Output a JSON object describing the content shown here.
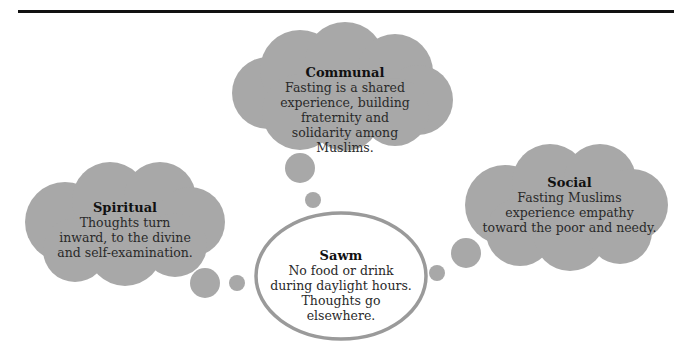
{
  "diagram": {
    "type": "thought-cloud-diagram",
    "colors": {
      "cloud_fill": "#a8a8a8",
      "center_stroke": "#9a9a9a",
      "rule": "#111111",
      "text": "#2a2a2a"
    },
    "center": {
      "title": "Sawm",
      "text": "No food or drink during daylight hours. Thoughts go elsewhere."
    },
    "clouds": [
      {
        "id": "communal",
        "title": "Communal",
        "text": "Fasting is a shared experience, building fraternity and solidarity among Muslims."
      },
      {
        "id": "spiritual",
        "title": "Spiritual",
        "text": "Thoughts turn inward, to the divine and self-examination."
      },
      {
        "id": "social",
        "title": "Social",
        "text": "Fasting Muslims experience empathy toward the poor and needy."
      }
    ]
  }
}
